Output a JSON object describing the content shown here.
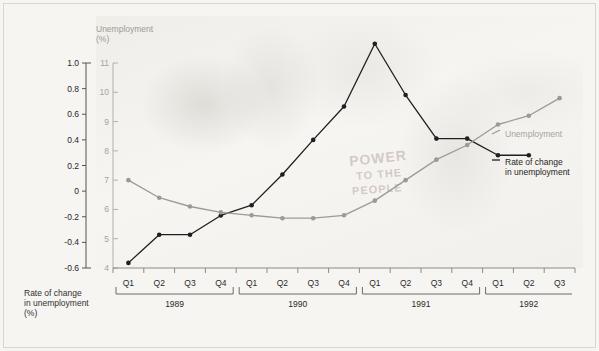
{
  "axes": {
    "left_title": "Rate of change\nin unemployment\n(%)",
    "right_title": "Unemployment\n(%)",
    "left_ticks": [
      "1.0",
      "0.8",
      "0.6",
      "0.4",
      "0.2",
      "0",
      "-0.2",
      "-0.4",
      "-0.6"
    ],
    "right_ticks": [
      "11",
      "10",
      "9",
      "8",
      "7",
      "6",
      "5",
      "4"
    ],
    "quarter_labels": [
      "Q1",
      "Q2",
      "Q3",
      "Q4",
      "Q1",
      "Q2",
      "Q3",
      "Q4",
      "Q1",
      "Q2",
      "Q3",
      "Q4",
      "Q1",
      "Q2",
      "Q3"
    ],
    "year_labels": [
      "1989",
      "1990",
      "1991",
      "1992"
    ]
  },
  "legend": {
    "unemployment": "Unemployment",
    "rate_of_change": "Rate of change\nin unemployment"
  },
  "graffiti": {
    "power": "POWER",
    "to_the": "TO THE",
    "people": "PEOPLE"
  },
  "colors": {
    "rate_series": "#1f1f22",
    "unemployment_series": "#9d9a95",
    "axis_left": "#55544f",
    "axis_right": "#b3b0aa",
    "background": "#f6f5f2"
  },
  "chart_data": {
    "type": "line",
    "title": "",
    "xlabel": "",
    "grid": false,
    "legend_position": "right-inside",
    "categories": [
      "Q1 1989",
      "Q2 1989",
      "Q3 1989",
      "Q4 1989",
      "Q1 1990",
      "Q2 1990",
      "Q3 1990",
      "Q4 1990",
      "Q1 1991",
      "Q2 1991",
      "Q3 1991",
      "Q4 1991",
      "Q1 1992",
      "Q2 1992",
      "Q3 1992"
    ],
    "series": [
      {
        "name": "Rate of change in unemployment",
        "axis": "left",
        "ylabel": "Rate of change in unemployment (%)",
        "ylim": [
          -0.6,
          1.0
        ],
        "color": "#1f1f22",
        "values": [
          -0.56,
          -0.34,
          -0.34,
          -0.19,
          -0.11,
          0.13,
          0.4,
          0.66,
          1.15,
          0.75,
          0.41,
          0.41,
          0.28,
          0.28,
          null
        ]
      },
      {
        "name": "Unemployment",
        "axis": "right",
        "ylabel": "Unemployment (%)",
        "ylim": [
          4,
          11
        ],
        "color": "#9d9a95",
        "values": [
          7.0,
          6.4,
          6.1,
          5.9,
          5.8,
          5.7,
          5.7,
          5.8,
          6.3,
          7.0,
          7.7,
          8.2,
          8.9,
          9.2,
          9.8
        ]
      }
    ]
  }
}
